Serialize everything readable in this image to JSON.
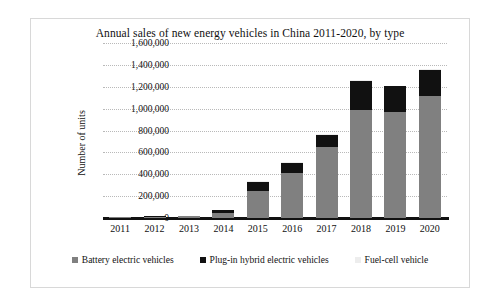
{
  "chart_data": {
    "type": "bar",
    "stacked": true,
    "title": "Annual sales of new energy vehicles in China 2011-2020, by type",
    "xlabel": "",
    "ylabel": "Number of units",
    "categories": [
      "2011",
      "2012",
      "2013",
      "2014",
      "2015",
      "2016",
      "2017",
      "2018",
      "2019",
      "2020"
    ],
    "series": [
      {
        "name": "Battery electric vehicles",
        "color": "#808080",
        "values": [
          5579,
          11375,
          14604,
          45048,
          247482,
          409000,
          652000,
          984000,
          972000,
          1117000
        ]
      },
      {
        "name": "Plug-in hybrid electric vehicles",
        "color": "#111111",
        "values": [
          1750,
          1416,
          3038,
          29715,
          83610,
          98000,
          111000,
          271000,
          232000,
          235000
        ]
      },
      {
        "name": "Fuel-cell vehicle",
        "color": "#eeeeee",
        "values": [
          0,
          0,
          0,
          0,
          10,
          629,
          1275,
          1527,
          2737,
          1177
        ]
      }
    ],
    "totals": [
      7329,
      12791,
      17642,
      74763,
      331102,
      507629,
      764275,
      1256527,
      1206737,
      1353177
    ],
    "ylim": [
      0,
      1600000
    ],
    "yticks": [
      0,
      200000,
      400000,
      600000,
      800000,
      1000000,
      1200000,
      1400000,
      1600000
    ],
    "ytick_labels": [
      "0",
      "200,000",
      "400,000",
      "600,000",
      "800,000",
      "1,000,000",
      "1,200,000",
      "1,400,000",
      "1,600,000"
    ],
    "grid": true,
    "legend_position": "bottom",
    "legend": [
      {
        "label": "Battery electric vehicles",
        "swatch": "gray-square-swatch"
      },
      {
        "label": "Plug-in hybrid electric vehicles",
        "swatch": "black-square-swatch"
      },
      {
        "label": "Fuel-cell vehicle",
        "swatch": "light-gray-square-swatch"
      }
    ],
    "colors": {
      "bev": "#808080",
      "phev": "#111111",
      "fcv": "#eeeeee",
      "axis": "#111111",
      "grid": "#b9b9b9",
      "background": "#ffffff"
    }
  }
}
